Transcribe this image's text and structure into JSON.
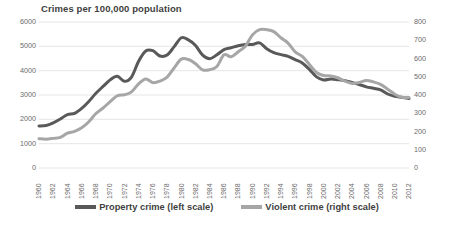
{
  "chart_data": {
    "type": "line",
    "title": "Crimes per 100,000 population",
    "xlabel": "",
    "ylabel": "",
    "grid": true,
    "legend_position": "bottom",
    "x": [
      1960,
      1961,
      1962,
      1963,
      1964,
      1965,
      1966,
      1967,
      1968,
      1969,
      1970,
      1971,
      1972,
      1973,
      1974,
      1975,
      1976,
      1977,
      1978,
      1979,
      1980,
      1981,
      1982,
      1983,
      1984,
      1985,
      1986,
      1987,
      1988,
      1989,
      1990,
      1991,
      1992,
      1993,
      1994,
      1995,
      1996,
      1997,
      1998,
      1999,
      2000,
      2001,
      2002,
      2003,
      2004,
      2005,
      2006,
      2007,
      2008,
      2009,
      2010,
      2011,
      2012
    ],
    "x_tick_labels": [
      "1960",
      "1962",
      "1964",
      "1966",
      "1968",
      "1970",
      "1972",
      "1974",
      "1976",
      "1978",
      "1980",
      "1982",
      "1984",
      "1986",
      "1988",
      "1990",
      "1992",
      "1994",
      "1996",
      "1998",
      "2000",
      "2002",
      "2004",
      "2006",
      "2008",
      "2010",
      "2012"
    ],
    "left_axis": {
      "label": "",
      "ticks": [
        0,
        1000,
        2000,
        3000,
        4000,
        5000,
        6000
      ],
      "ylim": [
        0,
        6000
      ]
    },
    "right_axis": {
      "label": "",
      "ticks": [
        0,
        100,
        200,
        300,
        400,
        500,
        600,
        700,
        800
      ],
      "ylim": [
        0,
        800
      ]
    },
    "series": [
      {
        "name": "Property crime (left scale)",
        "axis": "left",
        "color": "#595959",
        "values": [
          1726,
          1747,
          1857,
          2012,
          2198,
          2249,
          2451,
          2736,
          3071,
          3351,
          3621,
          3769,
          3561,
          3737,
          4389,
          4811,
          4820,
          4602,
          4643,
          4986,
          5353,
          5264,
          5033,
          4637,
          4492,
          4651,
          4863,
          4940,
          5027,
          5078,
          5073,
          5140,
          4903,
          4740,
          4660,
          4591,
          4451,
          4316,
          4053,
          3744,
          3618,
          3658,
          3631,
          3591,
          3514,
          3432,
          3335,
          3276,
          3215,
          3041,
          2946,
          2905,
          2859
        ]
      },
      {
        "name": "Violent crime (right scale)",
        "axis": "right",
        "color": "#a6a6a6",
        "values": [
          160.9,
          158.1,
          162.3,
          168.2,
          190.6,
          200.2,
          220.0,
          253.2,
          298.4,
          328.7,
          363.5,
          396.0,
          401.0,
          417.4,
          461.1,
          487.8,
          467.8,
          475.9,
          497.8,
          548.9,
          596.6,
          594.3,
          571.1,
          537.7,
          539.2,
          556.6,
          620.1,
          609.7,
          637.2,
          666.9,
          729.6,
          758.2,
          757.7,
          747.1,
          713.6,
          684.5,
          636.6,
          611.0,
          567.6,
          523.0,
          506.5,
          504.5,
          494.4,
          475.8,
          463.2,
          469.0,
          479.3,
          471.8,
          458.6,
          431.9,
          404.5,
          387.1,
          386.9
        ]
      }
    ]
  },
  "legend": {
    "items": [
      {
        "label": "Property crime (left scale)",
        "color": "#595959",
        "name": "legend-property-crime"
      },
      {
        "label": "Violent crime (right scale)",
        "color": "#a6a6a6",
        "name": "legend-violent-crime"
      }
    ]
  },
  "colors": {
    "property": "#595959",
    "violent": "#a6a6a6",
    "grid": "#e6e6e6",
    "text": "#3f3f3f",
    "axis_text": "#6b6b6b",
    "background": "#ffffff"
  }
}
